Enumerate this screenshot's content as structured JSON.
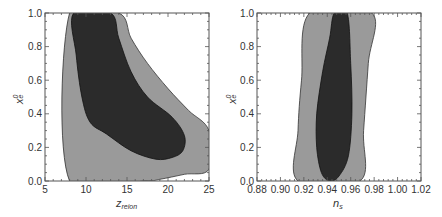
{
  "colors": {
    "region_95": "#9a9a9a",
    "region_68": "#2b2b2b",
    "frame": "#555555",
    "background": "#ffffff"
  },
  "chart_data": [
    {
      "type": "contour",
      "title": "",
      "xlabel": "z_reion",
      "xlabel_main": "z",
      "xlabel_sub": "reion",
      "ylabel": "x_e^0",
      "ylabel_main": "x",
      "ylabel_sup": "0",
      "ylabel_sub": "e",
      "xlim": [
        5,
        25
      ],
      "ylim": [
        0.0,
        1.0
      ],
      "xticks": [
        "5",
        "10",
        "15",
        "20",
        "25"
      ],
      "yticks": [
        "0.0",
        "0.2",
        "0.4",
        "0.6",
        "0.8",
        "1.0"
      ],
      "grid": false,
      "legend": "none",
      "regions": [
        {
          "name": "95% confidence (light gray)",
          "boundary": [
            [
              8.0,
              0.0
            ],
            [
              8.0,
              1.0
            ],
            [
              14.0,
              1.0
            ],
            [
              15.5,
              0.85
            ],
            [
              17.5,
              0.7
            ],
            [
              20.0,
              0.55
            ],
            [
              22.5,
              0.42
            ],
            [
              25.0,
              0.3
            ],
            [
              25.0,
              0.07
            ],
            [
              22.0,
              0.04
            ],
            [
              19.0,
              0.01
            ],
            [
              17.0,
              0.0
            ]
          ]
        },
        {
          "name": "68% confidence (dark)",
          "boundary": [
            [
              8.5,
              1.0
            ],
            [
              13.0,
              1.0
            ],
            [
              14.0,
              0.85
            ],
            [
              15.5,
              0.65
            ],
            [
              17.5,
              0.5
            ],
            [
              20.5,
              0.38
            ],
            [
              22.0,
              0.27
            ],
            [
              21.8,
              0.18
            ],
            [
              20.5,
              0.14
            ],
            [
              18.5,
              0.13
            ],
            [
              15.5,
              0.18
            ],
            [
              12.5,
              0.28
            ],
            [
              10.5,
              0.35
            ],
            [
              9.5,
              0.5
            ],
            [
              8.8,
              0.75
            ]
          ]
        }
      ]
    },
    {
      "type": "contour",
      "title": "",
      "xlabel": "n_s",
      "xlabel_main": "n",
      "xlabel_sub": "s",
      "ylabel": "x_e^0",
      "ylabel_main": "x",
      "ylabel_sup": "0",
      "ylabel_sub": "e",
      "xlim": [
        0.88,
        1.02
      ],
      "ylim": [
        0.0,
        1.0
      ],
      "xticks": [
        "0.88",
        "0.90",
        "0.92",
        "0.94",
        "0.96",
        "0.98",
        "1.00",
        "1.02"
      ],
      "yticks": [
        "0.0",
        "0.2",
        "0.4",
        "0.6",
        "0.8",
        "1.0"
      ],
      "grid": false,
      "legend": "none",
      "regions": [
        {
          "name": "95% confidence (light gray)",
          "boundary": [
            [
              0.915,
              0.0
            ],
            [
              0.915,
              0.3
            ],
            [
              0.918,
              0.6
            ],
            [
              0.925,
              1.0
            ],
            [
              0.978,
              1.0
            ],
            [
              0.975,
              0.7
            ],
            [
              0.971,
              0.3
            ],
            [
              0.968,
              0.0
            ]
          ]
        },
        {
          "name": "68% confidence (dark)",
          "boundary": [
            [
              0.946,
              1.0
            ],
            [
              0.957,
              1.0
            ],
            [
              0.96,
              0.7
            ],
            [
              0.961,
              0.4
            ],
            [
              0.958,
              0.15
            ],
            [
              0.95,
              0.03
            ],
            [
              0.942,
              0.0
            ],
            [
              0.935,
              0.05
            ],
            [
              0.931,
              0.2
            ],
            [
              0.931,
              0.4
            ],
            [
              0.936,
              0.65
            ],
            [
              0.942,
              0.85
            ]
          ]
        }
      ]
    }
  ]
}
